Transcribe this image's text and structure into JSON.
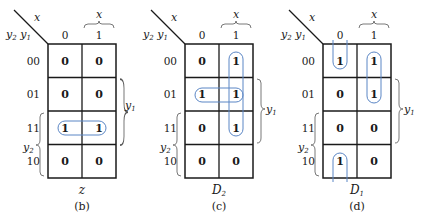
{
  "colors": {
    "grid": "#1a1a1a",
    "loop": "#5b86c5",
    "text": "#1a1a1a"
  },
  "labels": {
    "col_var": "x",
    "row_var_a": "y",
    "row_var_a_sub": "2",
    "row_var_b": "y",
    "row_var_b_sub": "1",
    "col_brace_var": "x",
    "right_brace_var": "y",
    "right_brace_sub": "1",
    "left_brace_var": "y",
    "left_brace_sub": "2",
    "col_headers": [
      "0",
      "1"
    ],
    "row_headers": [
      "00",
      "01",
      "11",
      "10"
    ]
  },
  "maps": [
    {
      "id": "b",
      "function_name": "z",
      "function_sub": "",
      "caption": "(b)",
      "cells": [
        [
          "0",
          "0"
        ],
        [
          "0",
          "0"
        ],
        [
          "1",
          "1"
        ],
        [
          "0",
          "0"
        ]
      ]
    },
    {
      "id": "c",
      "function_name": "D",
      "function_sub": "2",
      "caption": "(c)",
      "cells": [
        [
          "0",
          "1"
        ],
        [
          "1",
          "1"
        ],
        [
          "0",
          "1"
        ],
        [
          "0",
          "0"
        ]
      ]
    },
    {
      "id": "d",
      "function_name": "D",
      "function_sub": "1",
      "caption": "(d)",
      "cells": [
        [
          "1",
          "1"
        ],
        [
          "0",
          "1"
        ],
        [
          "0",
          "0"
        ],
        [
          "1",
          "0"
        ]
      ]
    }
  ]
}
